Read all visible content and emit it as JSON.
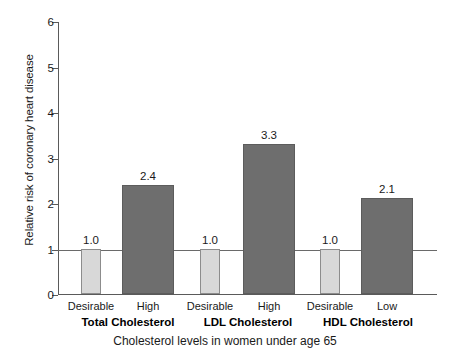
{
  "chart_data": {
    "type": "bar",
    "title": "",
    "subtitle": "",
    "xlabel": "Cholesterol levels in women under age 65",
    "ylabel": "Relative risk of coronary heart disease",
    "ylim": [
      0,
      6
    ],
    "yticks": [
      0,
      1,
      2,
      3,
      4,
      5,
      6
    ],
    "ytick_labels": [
      "0",
      "1",
      "2",
      "3",
      "4",
      "5",
      "6"
    ],
    "grid": false,
    "legend": "none",
    "reference_line": 1.0,
    "groups": [
      {
        "name": "Total Cholesterol",
        "bars": [
          {
            "category": "Desirable",
            "value": 1.0,
            "label": "1.0",
            "style": "light"
          },
          {
            "category": "High",
            "value": 2.4,
            "label": "2.4",
            "style": "dark"
          }
        ]
      },
      {
        "name": "LDL Cholesterol",
        "bars": [
          {
            "category": "Desirable",
            "value": 1.0,
            "label": "1.0",
            "style": "light"
          },
          {
            "category": "High",
            "value": 3.3,
            "label": "3.3",
            "style": "dark"
          }
        ]
      },
      {
        "name": "HDL Cholesterol",
        "bars": [
          {
            "category": "Desirable",
            "value": 1.0,
            "label": "1.0",
            "style": "light"
          },
          {
            "category": "Low",
            "value": 2.1,
            "label": "2.1",
            "style": "dark"
          }
        ]
      }
    ],
    "categories": [
      "Desirable",
      "High",
      "Desirable",
      "High",
      "Desirable",
      "Low"
    ],
    "values": [
      1.0,
      2.4,
      1.0,
      3.3,
      1.0,
      2.1
    ],
    "colors": {
      "light_bar": "#d8d8d8",
      "dark_bar": "#6e6e6e",
      "axis": "#5a5a5a",
      "text": "#1a1a1a",
      "background": "#ffffff"
    }
  },
  "layout": {
    "bar_geometry": [
      {
        "left": 23,
        "width": 20,
        "style": "light"
      },
      {
        "left": 64,
        "width": 52,
        "style": "dark"
      },
      {
        "left": 142,
        "width": 20,
        "style": "light"
      },
      {
        "left": 185,
        "width": 52,
        "style": "dark"
      },
      {
        "left": 262,
        "width": 20,
        "style": "light"
      },
      {
        "left": 303,
        "width": 52,
        "style": "dark"
      }
    ],
    "group_centers": [
      70,
      190,
      310
    ]
  }
}
